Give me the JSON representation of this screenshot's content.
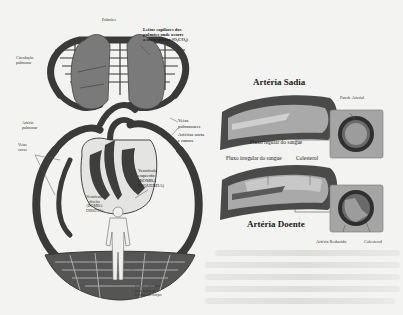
{
  "circulatory_diagram": {
    "labels": {
      "lungs": "Pulmões",
      "lung_capillaries": "Leitos capilares dos\npulmões onde ocorre\na troca gasosa (O₂CO₂)",
      "pulmonary_circulation": "Circulação\npulmonar",
      "pulmonary_artery": "Artéria\npulmonar",
      "vena_cava": "Veias\ncavas",
      "pulmonary_veins": "Veias\npulmonares",
      "aorta": "Artérias aorta\ne ramos",
      "left_ventricle": "Ventrículo\nesquerdo\n(BOMBA\nESQUERDA)",
      "right_ventricle": "Ventrículo\ndireito\n(BOMBA\nDIREITA)",
      "body_capillaries": "Leitos capilares\npara todos os\ntecidos do corpo"
    }
  },
  "artery_diagram": {
    "healthy": {
      "title": "Artéria Sadia",
      "wall_label": "Parede Arterial",
      "flow_label": "Fluxo regular do sangue"
    },
    "diseased": {
      "title": "Artéria Doente",
      "flow_label": "Fluxo irregular do sangue",
      "cholesterol_label": "Colesterol",
      "reduced_label": "Artéria Reduzida",
      "cholesterol_label_2": "Colesterol"
    }
  },
  "colors": {
    "background": "#f3f3f1",
    "vessel_dark": "#3a3a3a",
    "organ_gray": "#7a7a7a",
    "artery_inner": "#b8b8b8",
    "panel_gray": "#a9a9a9"
  }
}
